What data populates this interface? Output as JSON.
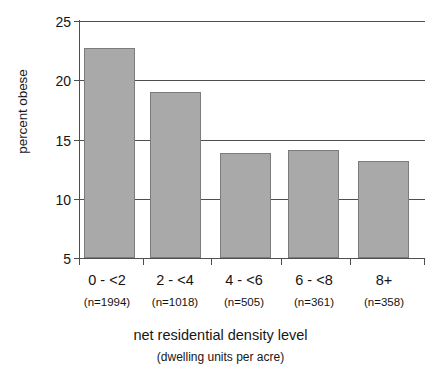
{
  "chart_data": {
    "type": "bar",
    "title": "",
    "xlabel": "net residential density level",
    "xlabel_sub": "(dwelling units per acre)",
    "ylabel": "percent obese",
    "ylim": [
      5,
      25
    ],
    "yticks": [
      5,
      10,
      15,
      20,
      25
    ],
    "ytick_labels": [
      "5",
      "10",
      "15",
      "20",
      "25"
    ],
    "grid": "horizontal",
    "legend": "none",
    "categories": [
      "0 - <2",
      "2 - <4",
      "4 - <6",
      "6 - <8",
      "8+"
    ],
    "values": [
      22.7,
      19.0,
      13.9,
      14.1,
      13.2
    ],
    "sample_sizes": [
      "(n=1994)",
      "(n=1018)",
      "(n=505)",
      "(n=361)",
      "(n=358)"
    ],
    "bar_color": "#a9a9a9",
    "bar_border_color": "#7c7c7c",
    "axis_color": "#4e4e4e"
  }
}
